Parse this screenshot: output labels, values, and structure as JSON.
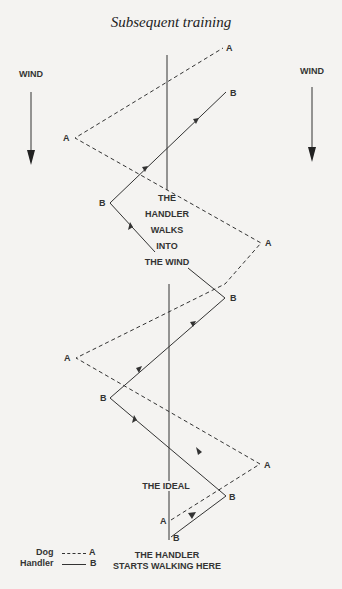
{
  "title": "Subsequent training",
  "wind_labels": {
    "left": "WIND",
    "right": "WIND"
  },
  "points": {
    "dog": "A",
    "handler": "B"
  },
  "annotation_walk": [
    "THE",
    "HANDLER",
    "WALKS",
    "INTO",
    "THE WIND"
  ],
  "annotation_ideal": "THE IDEAL",
  "start_label": [
    "THE HANDLER",
    "STARTS WALKING HERE"
  ],
  "legend": {
    "dog": {
      "name": "Dog",
      "line": "dashed",
      "point": "A"
    },
    "handler": {
      "name": "Handler",
      "line": "solid",
      "point": "B"
    }
  },
  "colors": {
    "ink": "#333333",
    "background": "#f4f3f1"
  }
}
